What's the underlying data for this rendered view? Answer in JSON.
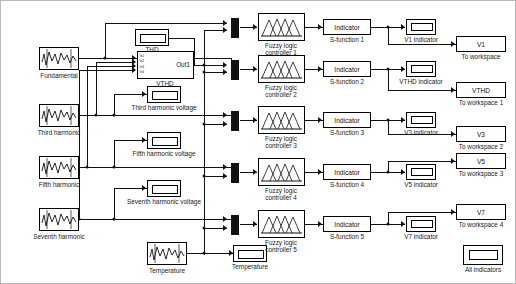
{
  "diagram": {
    "background": "#ffffff",
    "line_color": "#111111"
  },
  "sources": [
    {
      "name": "Fundamental",
      "icon": "signal-generator-icon"
    },
    {
      "name": "Third harmonic",
      "icon": "signal-generator-icon"
    },
    {
      "name": "Fifth harmonic",
      "icon": "signal-generator-icon"
    },
    {
      "name": "Seventh harmonic",
      "icon": "signal-generator-icon"
    },
    {
      "name": "Temperature",
      "icon": "signal-generator-icon"
    }
  ],
  "subsystem": {
    "label": "VTHD",
    "out_label": "Out1",
    "ports": [
      "In1",
      "In2",
      "In3",
      "In4"
    ]
  },
  "scopes": [
    {
      "name": "THD",
      "icon": "display-icon"
    },
    {
      "name": "Third harmonic voltage",
      "icon": "display-icon"
    },
    {
      "name": "Fifth harmonic voltage",
      "icon": "display-icon"
    },
    {
      "name": "Seventh harmonic voltage",
      "icon": "display-icon"
    },
    {
      "name": "Temperature",
      "icon": "display-icon"
    }
  ],
  "mux_blocks": [
    {
      "name": "mux-1",
      "inputs": 2
    },
    {
      "name": "mux-2",
      "inputs": 2
    },
    {
      "name": "mux-3",
      "inputs": 2
    },
    {
      "name": "mux-4",
      "inputs": 2
    },
    {
      "name": "mux-5",
      "inputs": 2
    }
  ],
  "rows": [
    {
      "fuzzy_label_line1": "Fuzzy logic",
      "fuzzy_label_line2": "controller 1",
      "sfunction_text": "Indicator",
      "sfunction_label": "S-function 1",
      "indicator_label": "V1 indicator",
      "workspace_text": "V1",
      "workspace_label": "To workspace"
    },
    {
      "fuzzy_label_line1": "Fuzzy logic",
      "fuzzy_label_line2": "controller 2",
      "sfunction_text": "Indicator",
      "sfunction_label": "S-function 2",
      "indicator_label": "VTHD indicator",
      "workspace_text": "VTHD",
      "workspace_label": "To workspace 1"
    },
    {
      "fuzzy_label_line1": "Fuzzy logic",
      "fuzzy_label_line2": "controller 3",
      "sfunction_text": "Indicator",
      "sfunction_label": "S-function 3",
      "indicator_label": "V3 indicator",
      "workspace_text": "V3",
      "workspace_label": "To workspace 2"
    },
    {
      "fuzzy_label_line1": "Fuzzy logic",
      "fuzzy_label_line2": "controller 4",
      "sfunction_text": "Indicator",
      "sfunction_label": "S-function 4",
      "indicator_label": "V5 indicator",
      "workspace_text": "V5",
      "workspace_label": "To workspace 3"
    },
    {
      "fuzzy_label_line1": "Fuzzy logic",
      "fuzzy_label_line2": "controller 5",
      "sfunction_text": "Indicator",
      "sfunction_label": "S-function 5",
      "indicator_label": "V7 indicator",
      "workspace_text": "V7",
      "workspace_label": "To workspace 4"
    }
  ],
  "all_indicators": {
    "label": "All indicators",
    "icon": "display-icon"
  }
}
